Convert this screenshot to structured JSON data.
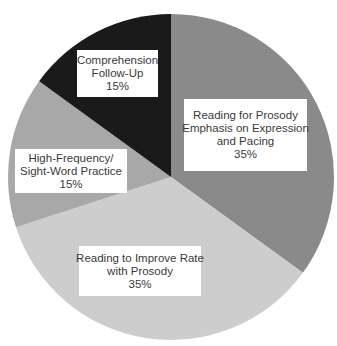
{
  "chart_data": {
    "type": "pie",
    "title": "",
    "start_angle_deg": 0,
    "direction": "clockwise",
    "slices": [
      {
        "label": "Reading for Prosody Emphasis on Expression and Pacing",
        "lines": [
          "Reading for Prosody",
          "Emphasis on Expression",
          "and Pacing"
        ],
        "value": 35,
        "pct_label": "35%",
        "color": "#8a8a8a"
      },
      {
        "label": "Reading to Improve Rate with Prosody",
        "lines": [
          "Reading to Improve Rate",
          "with Prosody"
        ],
        "value": 35,
        "pct_label": "35%",
        "color": "#cdcdcd"
      },
      {
        "label": "High-Frequency/ Sight-Word Practice",
        "lines": [
          "High-Frequency/",
          "Sight-Word Practice"
        ],
        "value": 15,
        "pct_label": "15%",
        "color": "#a8a8a8"
      },
      {
        "label": "Comprehension Follow-Up",
        "lines": [
          "Comprehension",
          "Follow-Up"
        ],
        "value": 15,
        "pct_label": "15%",
        "color": "#1a1a1a"
      }
    ]
  },
  "layout": {
    "center": [
      171,
      177
    ],
    "radius": 163,
    "labels": [
      {
        "left": 184,
        "top": 99,
        "width": 123,
        "height": 72
      },
      {
        "left": 79,
        "top": 246,
        "width": 122,
        "height": 50
      },
      {
        "left": 15,
        "top": 149,
        "width": 112,
        "height": 44
      },
      {
        "left": 77,
        "top": 50,
        "width": 81,
        "height": 47
      }
    ]
  }
}
